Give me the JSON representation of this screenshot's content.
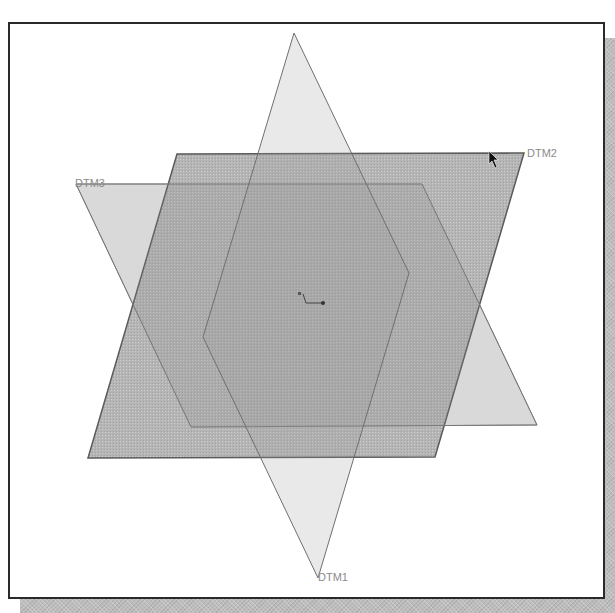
{
  "viewport": {
    "background": "#ffffff",
    "border_color": "#2a2a2a",
    "shadow_color": "#bdbdbd"
  },
  "datum_planes": [
    {
      "name": "DTM1",
      "label": "DTM1",
      "shape": "rhombus",
      "fill": "#d9d9d9",
      "fill_opacity": 0.35,
      "edge_color": "#808080"
    },
    {
      "name": "DTM2",
      "label": "DTM2",
      "shape": "parallelogram",
      "fill": "#9a9a9a",
      "fill_opacity": 0.6,
      "edge_color": "#5a5a5a"
    },
    {
      "name": "DTM3",
      "label": "DTM3",
      "shape": "parallelogram",
      "fill": "#b0b0b0",
      "fill_opacity": 0.35,
      "edge_color": "#8a8a8a"
    }
  ],
  "origin_triad": {
    "icon": "coordinate-system-icon"
  },
  "cursor": {
    "icon": "arrow-pointer-icon"
  }
}
